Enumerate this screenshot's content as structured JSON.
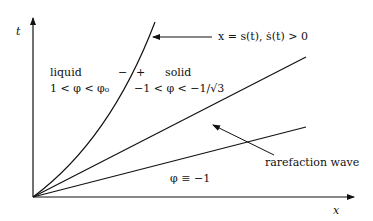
{
  "axes": {
    "x_label": "x",
    "y_label": "t"
  },
  "regions": {
    "liquid_title": "liquid",
    "liquid_condition": "1 < φ < φ₀",
    "solid_title": "solid",
    "solid_condition": "−1 < φ < −1/√3",
    "minus_sign": "−",
    "plus_sign": "+",
    "bottom_condition": "φ ≡ −1"
  },
  "annotations": {
    "free_boundary": "x = s(t), ṡ(t) > 0",
    "rarefaction": "rarefaction wave"
  },
  "colors": {
    "line": "#111111",
    "background": "#ffffff"
  }
}
